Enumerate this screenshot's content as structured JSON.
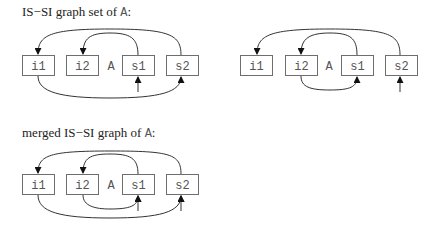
{
  "captions": {
    "set_prefix": "IS−SI graph set of ",
    "set_var": "A",
    "set_suffix": ":",
    "merged_prefix": "merged IS−SI graph of ",
    "merged_var": "A",
    "merged_suffix": ":"
  },
  "center_label": "A",
  "nodes": {
    "i1": "i1",
    "i2": "i2",
    "s1": "s1",
    "s2": "s2"
  },
  "graphs": [
    {
      "name": "graph-1",
      "edges": [
        {
          "from": "s1",
          "to": "i2"
        },
        {
          "from": "s2",
          "to": "i1"
        },
        {
          "from": "i1",
          "to": "s2"
        },
        {
          "from": "input",
          "to": "s1"
        }
      ]
    },
    {
      "name": "graph-2",
      "edges": [
        {
          "from": "s1",
          "to": "i2"
        },
        {
          "from": "s2",
          "to": "i1"
        },
        {
          "from": "i2",
          "to": "s1"
        },
        {
          "from": "input",
          "to": "s2"
        }
      ]
    },
    {
      "name": "merged-graph",
      "edges": [
        {
          "from": "s1",
          "to": "i2"
        },
        {
          "from": "s2",
          "to": "i1"
        },
        {
          "from": "i1",
          "to": "s2"
        },
        {
          "from": "i2",
          "to": "s1"
        },
        {
          "from": "input",
          "to": "s1"
        },
        {
          "from": "input",
          "to": "s2"
        }
      ]
    }
  ]
}
